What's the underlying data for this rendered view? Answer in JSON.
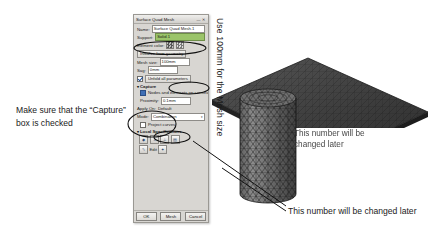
{
  "dialog": {
    "title": "Surface Quad Mesh",
    "window_controls": "— ✕",
    "fields": {
      "name_label": "Name:",
      "name_value": "Surface Quad Mesh.1",
      "support_label": "Support:",
      "support_value": "Solid.1",
      "element_color_label": "Element color:",
      "initialize_label": "Initialize from geometry",
      "mesh_size_label": "Mesh size:",
      "mesh_size_value": "100mm",
      "sag_label": "Sag:",
      "sag_value": "0mm",
      "all_parameters_label": "Unfold all parameters"
    },
    "capture": {
      "section_label": "Capture",
      "caret": "▾",
      "nodes_checkbox_label": "Nodes and elements on constraints",
      "proximity_label": "Proximity:",
      "proximity_value": "0.1mm"
    },
    "apply_on": {
      "label": "Apply On:",
      "value": "Default"
    },
    "mode": {
      "label": "Mode:",
      "value": "Combination",
      "arrow": "▾"
    },
    "project_curves_label": "Project curves",
    "local_specs": {
      "section_label": "Local Specifications",
      "caret": "▾",
      "tool_icons": [
        "pin-icon",
        "anchor-icon",
        "constraint-icon",
        "table-icon"
      ],
      "edit_label": "Edit",
      "edit_icon": "edit-icon",
      "extra_icon": "wand-icon"
    },
    "buttons": {
      "ok": "OK",
      "mesh": "Mesh",
      "cancel": "Cancel"
    }
  },
  "annotations": {
    "left_note": "Make sure that the “Capture” box is checked",
    "vertical_note": "Use 100mm for the Mesh size",
    "bottom_note": "This number will be changed later",
    "cylinder_note": "This number will be changed later"
  },
  "colors": {
    "dialog_bg": "#d8d6d2",
    "selection_green": "#9bc46a",
    "ink": "#1a1a1a",
    "mesh_dark": "#3b3b3b",
    "slab_fill": "#4a4a4a"
  },
  "scene": {
    "objects": [
      "meshed-plane",
      "meshed-cylinder",
      "vertical-axis"
    ]
  }
}
